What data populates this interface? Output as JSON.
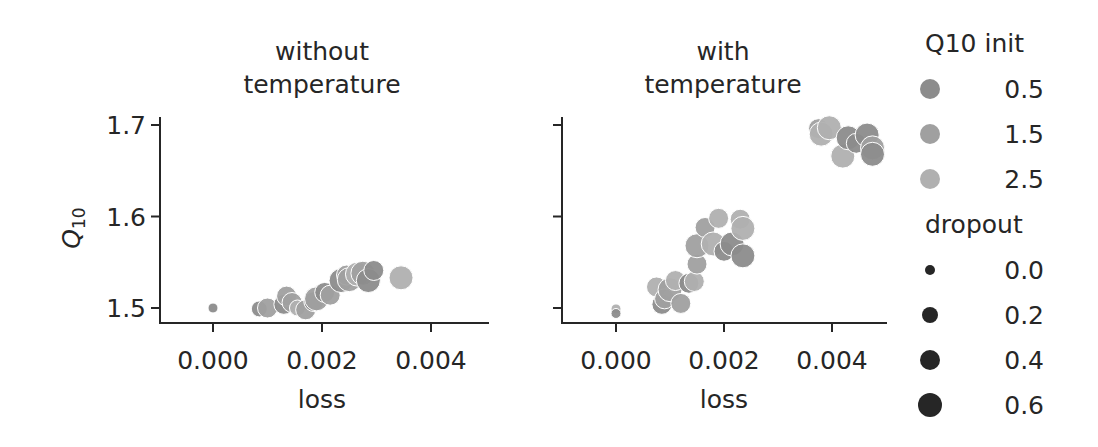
{
  "chart_data": [
    {
      "type": "scatter",
      "title": "without\ntemperature",
      "title_lines": [
        "without",
        "temperature"
      ],
      "xlabel": "loss",
      "ylabel": "Q10",
      "xlim": [
        -0.0005,
        0.005
      ],
      "ylim": [
        1.485,
        1.71
      ],
      "xticks": [
        "0.000",
        "0.002",
        "0.004"
      ],
      "yticks": [
        "1.5",
        "1.6",
        "1.7"
      ],
      "grid": false,
      "points": [
        {
          "x": 0.0,
          "y": 1.5,
          "q10": 0.5,
          "dropout": 0.0
        },
        {
          "x": 0.00085,
          "y": 1.499,
          "q10": 0.5,
          "dropout": 0.2
        },
        {
          "x": 0.001,
          "y": 1.5,
          "q10": 1.5,
          "dropout": 0.4
        },
        {
          "x": 0.0013,
          "y": 1.504,
          "q10": 0.5,
          "dropout": 0.4
        },
        {
          "x": 0.00135,
          "y": 1.513,
          "q10": 1.5,
          "dropout": 0.4
        },
        {
          "x": 0.00145,
          "y": 1.506,
          "q10": 1.5,
          "dropout": 0.4
        },
        {
          "x": 0.00155,
          "y": 1.5,
          "q10": 2.5,
          "dropout": 0.2
        },
        {
          "x": 0.0017,
          "y": 1.498,
          "q10": 1.5,
          "dropout": 0.4
        },
        {
          "x": 0.00185,
          "y": 1.507,
          "q10": 0.5,
          "dropout": 0.4
        },
        {
          "x": 0.0019,
          "y": 1.51,
          "q10": 1.5,
          "dropout": 0.6
        },
        {
          "x": 0.00205,
          "y": 1.517,
          "q10": 0.5,
          "dropout": 0.4
        },
        {
          "x": 0.00215,
          "y": 1.514,
          "q10": 1.5,
          "dropout": 0.4
        },
        {
          "x": 0.00235,
          "y": 1.53,
          "q10": 0.5,
          "dropout": 0.6
        },
        {
          "x": 0.00245,
          "y": 1.536,
          "q10": 1.5,
          "dropout": 0.4
        },
        {
          "x": 0.0025,
          "y": 1.531,
          "q10": 1.5,
          "dropout": 0.6
        },
        {
          "x": 0.00265,
          "y": 1.537,
          "q10": 2.5,
          "dropout": 0.6
        },
        {
          "x": 0.00275,
          "y": 1.538,
          "q10": 1.5,
          "dropout": 0.6
        },
        {
          "x": 0.00285,
          "y": 1.53,
          "q10": 0.5,
          "dropout": 0.6
        },
        {
          "x": 0.00295,
          "y": 1.541,
          "q10": 0.5,
          "dropout": 0.4
        },
        {
          "x": 0.00345,
          "y": 1.533,
          "q10": 2.5,
          "dropout": 0.6
        }
      ]
    },
    {
      "type": "scatter",
      "title": "with\ntemperature",
      "title_lines": [
        "with",
        "temperature"
      ],
      "xlabel": "loss",
      "ylabel": "",
      "xlim": [
        -0.0005,
        0.005
      ],
      "ylim": [
        1.485,
        1.71
      ],
      "xticks": [
        "0.000",
        "0.002",
        "0.004"
      ],
      "yticks": [
        "1.5",
        "1.6",
        "1.7"
      ],
      "ytick_labels_visible": false,
      "grid": false,
      "points": [
        {
          "x": 0.0,
          "y": 1.499,
          "q10": 2.5,
          "dropout": 0.0
        },
        {
          "x": 0.0,
          "y": 1.494,
          "q10": 0.5,
          "dropout": 0.0
        },
        {
          "x": 0.00075,
          "y": 1.523,
          "q10": 2.5,
          "dropout": 0.4
        },
        {
          "x": 0.00085,
          "y": 1.504,
          "q10": 0.5,
          "dropout": 0.4
        },
        {
          "x": 0.0009,
          "y": 1.51,
          "q10": 1.5,
          "dropout": 0.4
        },
        {
          "x": 0.001,
          "y": 1.52,
          "q10": 1.5,
          "dropout": 0.6
        },
        {
          "x": 0.0011,
          "y": 1.53,
          "q10": 2.5,
          "dropout": 0.4
        },
        {
          "x": 0.0012,
          "y": 1.505,
          "q10": 1.5,
          "dropout": 0.4
        },
        {
          "x": 0.00135,
          "y": 1.527,
          "q10": 0.5,
          "dropout": 0.4
        },
        {
          "x": 0.00145,
          "y": 1.529,
          "q10": 2.5,
          "dropout": 0.4
        },
        {
          "x": 0.0015,
          "y": 1.548,
          "q10": 1.5,
          "dropout": 0.4
        },
        {
          "x": 0.0015,
          "y": 1.568,
          "q10": 1.5,
          "dropout": 0.6
        },
        {
          "x": 0.00165,
          "y": 1.588,
          "q10": 1.5,
          "dropout": 0.4
        },
        {
          "x": 0.0018,
          "y": 1.57,
          "q10": 2.5,
          "dropout": 0.6
        },
        {
          "x": 0.0019,
          "y": 1.598,
          "q10": 2.5,
          "dropout": 0.4
        },
        {
          "x": 0.002,
          "y": 1.562,
          "q10": 0.5,
          "dropout": 0.4
        },
        {
          "x": 0.00215,
          "y": 1.57,
          "q10": 0.5,
          "dropout": 0.6
        },
        {
          "x": 0.0023,
          "y": 1.597,
          "q10": 2.5,
          "dropout": 0.4
        },
        {
          "x": 0.00235,
          "y": 1.587,
          "q10": 2.5,
          "dropout": 0.6
        },
        {
          "x": 0.00235,
          "y": 1.557,
          "q10": 0.5,
          "dropout": 0.6
        },
        {
          "x": 0.00375,
          "y": 1.696,
          "q10": 1.5,
          "dropout": 0.4
        },
        {
          "x": 0.0038,
          "y": 1.69,
          "q10": 2.5,
          "dropout": 0.6
        },
        {
          "x": 0.00395,
          "y": 1.697,
          "q10": 2.5,
          "dropout": 0.6
        },
        {
          "x": 0.0042,
          "y": 1.666,
          "q10": 2.5,
          "dropout": 0.6
        },
        {
          "x": 0.0043,
          "y": 1.686,
          "q10": 0.5,
          "dropout": 0.6
        },
        {
          "x": 0.00445,
          "y": 1.68,
          "q10": 0.5,
          "dropout": 0.4
        },
        {
          "x": 0.00465,
          "y": 1.689,
          "q10": 0.5,
          "dropout": 0.6
        },
        {
          "x": 0.00475,
          "y": 1.675,
          "q10": 1.5,
          "dropout": 0.6
        },
        {
          "x": 0.00475,
          "y": 1.668,
          "q10": 0.5,
          "dropout": 0.6
        }
      ]
    }
  ],
  "legend": {
    "hue_title": "Q10 init",
    "hue_items": [
      {
        "label": "0.5",
        "color": "#8c8c8c"
      },
      {
        "label": "1.5",
        "color": "#a0a0a0"
      },
      {
        "label": "2.5",
        "color": "#b0b0b0"
      }
    ],
    "size_title": "dropout",
    "size_items": [
      {
        "label": "0.0",
        "radius": 5
      },
      {
        "label": "0.2",
        "radius": 8
      },
      {
        "label": "0.4",
        "radius": 10
      },
      {
        "label": "0.6",
        "radius": 12
      }
    ],
    "size_color": "#262626"
  },
  "style": {
    "axis_color": "#262626",
    "marker_edge": "#ffffff"
  }
}
